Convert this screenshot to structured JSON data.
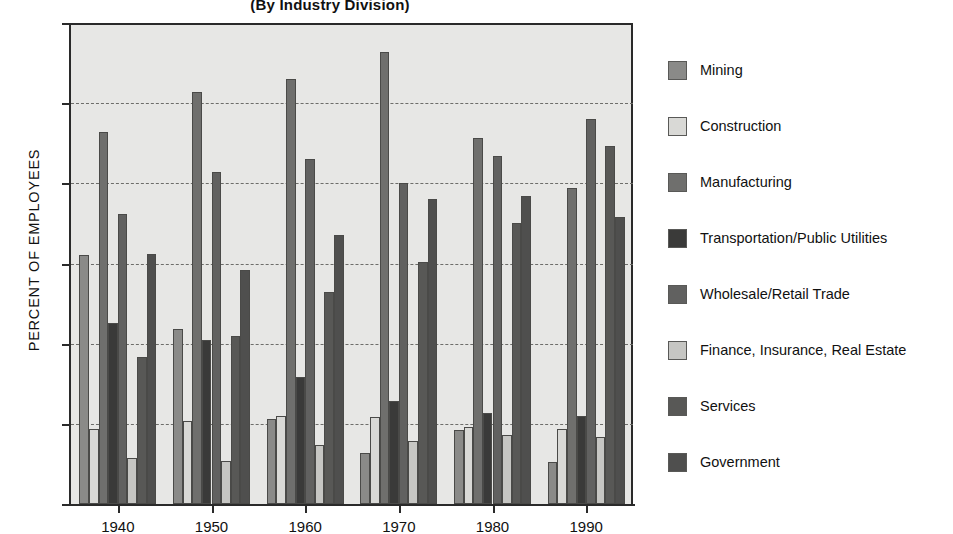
{
  "chart_data": {
    "type": "bar",
    "title": "(By Industry Division)",
    "xlabel": "",
    "ylabel": "PERCENT OF EMPLOYEES",
    "ylim": [
      0,
      30
    ],
    "yticks": [
      0,
      5,
      10,
      15,
      20,
      25,
      30
    ],
    "grid": true,
    "legend_position": "right",
    "categories": [
      "1940",
      "1950",
      "1960",
      "1970",
      "1980",
      "1990"
    ],
    "series": [
      {
        "name": "Mining",
        "color": "#8a8a88",
        "values": [
          15.5,
          10.9,
          5.3,
          3.2,
          4.6,
          2.6
        ]
      },
      {
        "name": "Construction",
        "color": "#d9d9d6",
        "values": [
          4.7,
          5.2,
          5.5,
          5.4,
          4.8,
          4.7
        ]
      },
      {
        "name": "Manufacturing",
        "color": "#6f6f6d",
        "values": [
          23.2,
          25.7,
          26.5,
          28.2,
          22.8,
          19.7
        ]
      },
      {
        "name": "Transportation/Public Utilities",
        "color": "#3a3a39",
        "values": [
          11.3,
          10.2,
          7.9,
          6.4,
          5.7,
          5.5
        ]
      },
      {
        "name": "Wholesale/Retail Trade",
        "color": "#616160",
        "values": [
          18.1,
          20.7,
          21.5,
          20.0,
          21.7,
          24.0
        ]
      },
      {
        "name": "Finance, Insurance, Real Estate",
        "color": "#c6c6c3",
        "values": [
          2.9,
          2.7,
          3.7,
          3.9,
          4.3,
          4.2
        ]
      },
      {
        "name": "Services",
        "color": "#585856",
        "values": [
          9.2,
          10.5,
          13.2,
          15.1,
          17.5,
          22.3
        ]
      },
      {
        "name": "Government",
        "color": "#4f4f4e",
        "values": [
          15.6,
          14.6,
          16.8,
          19.0,
          19.2,
          17.9
        ]
      }
    ]
  },
  "legend": {
    "items": [
      {
        "label": "Mining"
      },
      {
        "label": "Construction"
      },
      {
        "label": "Manufacturing"
      },
      {
        "label": "Transportation/Public Utilities"
      },
      {
        "label": "Wholesale/Retail Trade"
      },
      {
        "label": "Finance, Insurance, Real Estate"
      },
      {
        "label": "Services"
      },
      {
        "label": "Government"
      }
    ]
  }
}
